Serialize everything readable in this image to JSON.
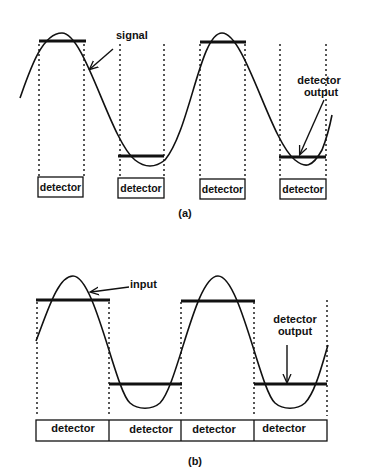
{
  "panel_a": {
    "caption": "(a)",
    "signal_label": "signal",
    "output_label_line1": "detector",
    "output_label_line2": "output",
    "detectors": [
      "detector",
      "detector",
      "detector",
      "detector"
    ]
  },
  "panel_b": {
    "caption": "(b)",
    "input_label": "input",
    "output_label_line1": "detector",
    "output_label_line2": "output",
    "detectors": [
      "detector",
      "detector",
      "detector",
      "detector"
    ]
  },
  "colors": {
    "stroke": "#111111",
    "background": "#ffffff"
  }
}
